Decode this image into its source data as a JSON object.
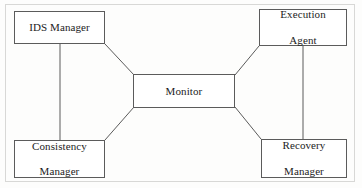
{
  "figure": {
    "width": 362,
    "height": 188,
    "background_color": "#fdfdfc",
    "line_color": "#5b5b5b",
    "text_color": "#1c1c1c",
    "frame_color": "#d8d8d6"
  },
  "nodes": [
    {
      "id": "ids-manager",
      "label_line1": "IDS Manager",
      "label_line2": ""
    },
    {
      "id": "execution-agent",
      "label_line1": "Execution",
      "label_line2": "Agent"
    },
    {
      "id": "monitor",
      "label_line1": "Monitor",
      "label_line2": ""
    },
    {
      "id": "consistency-manager",
      "label_line1": "Consistency",
      "label_line2": "Manager"
    },
    {
      "id": "recovery-manager",
      "label_line1": "Recovery",
      "label_line2": "Manager"
    }
  ],
  "edges": [
    {
      "id": "ids-manager-to-monitor",
      "from": "ids-manager",
      "to": "monitor",
      "x1": 105,
      "y1": 44,
      "x2": 134,
      "y2": 75
    },
    {
      "id": "monitor-to-execution-agent",
      "from": "monitor",
      "to": "execution-agent",
      "x1": 235,
      "y1": 75,
      "x2": 259,
      "y2": 46
    },
    {
      "id": "monitor-to-consistency-manager",
      "from": "monitor",
      "to": "consistency-manager",
      "x1": 134,
      "y1": 107,
      "x2": 105,
      "y2": 140
    },
    {
      "id": "monitor-to-recovery-manager",
      "from": "monitor",
      "to": "recovery-manager",
      "x1": 235,
      "y1": 107,
      "x2": 261,
      "y2": 139
    },
    {
      "id": "ids-manager-to-consistency-manager",
      "from": "ids-manager",
      "to": "consistency-manager",
      "x1": 60,
      "y1": 44,
      "x2": 60,
      "y2": 140
    },
    {
      "id": "execution-agent-to-recovery-manager",
      "from": "execution-agent",
      "to": "recovery-manager",
      "x1": 303,
      "y1": 46,
      "x2": 303,
      "y2": 139
    }
  ]
}
